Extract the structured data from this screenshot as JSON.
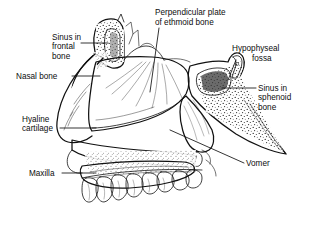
{
  "figure": {
    "background_color": "#ffffff",
    "ink_color": "#111111",
    "labels": [
      {
        "id": "sinus-in-frontal-bone",
        "text_lines": [
          "Sinus in",
          "frontal",
          "bone"
        ],
        "align": "left",
        "x": 52,
        "y": 33,
        "leader": "horizontal-right"
      },
      {
        "id": "perpendicular-plate-of-ethmoid-bone",
        "text_lines": [
          "Perpendicular plate",
          "of ethmoid bone"
        ],
        "align": "left",
        "x": 155,
        "y": 8,
        "leader": "diagonal-down-left"
      },
      {
        "id": "hypophyseal-fossa",
        "text_lines": [
          "Hypophyseal",
          "fossa"
        ],
        "align": "mixed",
        "x": 232,
        "y": 44,
        "leader": "diagonal-down-left"
      },
      {
        "id": "nasal-bone",
        "text_lines": [
          "Nasal bone"
        ],
        "align": "left",
        "x": 16,
        "y": 73,
        "leader": "horizontal-right"
      },
      {
        "id": "sinus-in-sphenoid-bone",
        "text_lines": [
          "Sinus in",
          "sphenoid",
          "bone"
        ],
        "align": "left",
        "x": 258,
        "y": 85,
        "leader": "horizontal-left"
      },
      {
        "id": "hyaline-cartilage",
        "text_lines": [
          "Hyaline",
          "cartilage"
        ],
        "align": "left",
        "x": 22,
        "y": 115,
        "leader": "horizontal-right"
      },
      {
        "id": "maxilla",
        "text_lines": [
          "Maxilla"
        ],
        "align": "left",
        "x": 29,
        "y": 170,
        "leader": "horizontal-right"
      },
      {
        "id": "vomer",
        "text_lines": [
          "Vomer"
        ],
        "align": "left",
        "x": 246,
        "y": 161,
        "leader": "diagonal-up-left"
      }
    ],
    "structures": [
      "frontal-sinus",
      "nasal-bone",
      "perpendicular-plate-of-ethmoid",
      "hyaline-cartilage",
      "sphenoid-sinus",
      "hypophyseal-fossa",
      "vomer",
      "maxilla",
      "hard-palate",
      "teeth"
    ],
    "tooth_count": 8
  }
}
